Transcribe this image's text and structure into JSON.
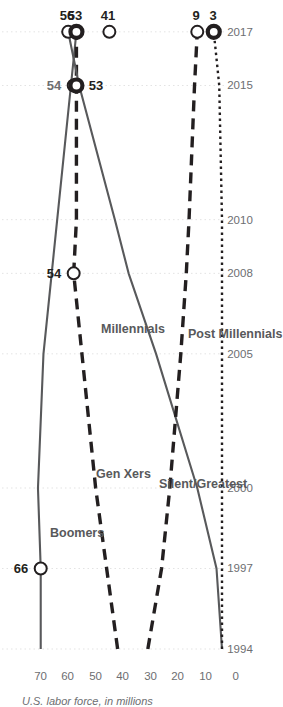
{
  "chart_data": {
    "type": "line",
    "title": "",
    "xlabel": "",
    "ylabel": "U.S. labor force, in millions",
    "x": [
      1994,
      1997,
      2000,
      2005,
      2008,
      2010,
      2015,
      2017
    ],
    "xticks": [
      "1994",
      "1997",
      "2000",
      "2005",
      "2008",
      "2010",
      "2015",
      "2017"
    ],
    "yticks": [
      "0",
      "10",
      "20",
      "30",
      "40",
      "50",
      "60",
      "70"
    ],
    "ylim": [
      0,
      75
    ],
    "xlim": [
      1994,
      2018
    ],
    "grid": "vertical-dotted",
    "legend": "inline-series-labels",
    "series": [
      {
        "name": "Boomers",
        "style": "solid",
        "color": "#58595b",
        "values": [
          66,
          66,
          67,
          65,
          62,
          60,
          55,
          53
        ]
      },
      {
        "name": "Gen Xers",
        "style": "long-dash",
        "color": "#231f20",
        "values": [
          38,
          42,
          46,
          51,
          54,
          53,
          53,
          53
        ]
      },
      {
        "name": "Millennials",
        "style": "solid",
        "color": "#58595b",
        "values": [
          0,
          2,
          9,
          24,
          34,
          39,
          52,
          56
        ]
      },
      {
        "name": "Silent/Greatest",
        "style": "long-dash",
        "color": "#231f20",
        "values": [
          27,
          22,
          19,
          15,
          13,
          12,
          10,
          9
        ]
      },
      {
        "name": "Post Millennials",
        "style": "fine-dot",
        "color": "#231f20",
        "values": [
          0,
          0,
          0,
          0,
          0,
          0,
          1,
          3
        ]
      }
    ],
    "annotations": [
      {
        "label": "66",
        "series": "Boomers",
        "year": 1997,
        "value": 66,
        "marker": "open-circle"
      },
      {
        "label": "54",
        "series": "Gen Xers",
        "year": 2008,
        "value": 54,
        "marker": "open-circle"
      },
      {
        "label": "56",
        "series": "Millennials",
        "year": 2017,
        "value": 56,
        "marker": "open-circle"
      },
      {
        "label": "53",
        "series": "Gen Xers",
        "year": 2017,
        "value": 53,
        "marker": "filled-ring"
      },
      {
        "label": "41",
        "series": "Silent-cross",
        "year": 2017,
        "value": 41,
        "marker": "open-circle"
      },
      {
        "label": "54",
        "series": "Boomers-2015",
        "year": 2015,
        "value": 54,
        "marker": "open-circle"
      },
      {
        "label": "53",
        "series": "Millennials-2015",
        "year": 2015,
        "value": 53,
        "marker": "filled-ring"
      },
      {
        "label": "9",
        "series": "Silent/Greatest",
        "year": 2017,
        "value": 9,
        "marker": "open-circle"
      },
      {
        "label": "3",
        "series": "Post Millennials",
        "year": 2017,
        "value": 3,
        "marker": "filled-ring"
      }
    ]
  },
  "axis": {
    "y_title": "U.S. labor force, in millions"
  },
  "ticks": {
    "x": [
      "1994",
      "1997",
      "2000",
      "2005",
      "2008",
      "2010",
      "2015",
      "2017"
    ],
    "y": [
      "0",
      "10",
      "20",
      "30",
      "40",
      "50",
      "60",
      "70"
    ]
  },
  "series_labels": {
    "boomers": "Boomers",
    "gen_xers": "Gen Xers",
    "millennials": "Millennials",
    "silent_greatest": "Silent/Greatest",
    "post_millennials": "Post Millennials"
  },
  "point_labels": {
    "boomers_1997": "66",
    "genx_2008": "54",
    "mill_2017": "56",
    "genx_2017": "53",
    "boom_2017": "41",
    "boom_2015": "54",
    "mill_2015": "53",
    "silent_2017": "9",
    "post_2017": "3"
  },
  "colors": {
    "line_dark": "#231f20",
    "line_gray": "#58595b",
    "text_gray": "#6d6e71",
    "grid": "#e3e3e3",
    "background": "#ffffff"
  }
}
